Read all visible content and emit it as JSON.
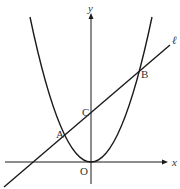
{
  "diagram": {
    "axes": {
      "x_label": "x",
      "y_label": "y",
      "origin_label": "O"
    },
    "line_label": "ℓ",
    "points": [
      {
        "name": "A",
        "label": "A"
      },
      {
        "name": "B",
        "label": "B"
      },
      {
        "name": "C",
        "label": "C"
      }
    ],
    "colors": {
      "stroke": "#1a1a1a",
      "text": "#333333",
      "background": "#ffffff"
    }
  }
}
